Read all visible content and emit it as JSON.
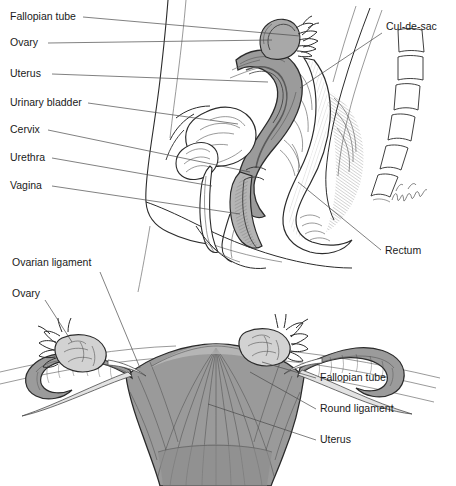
{
  "figure": {
    "background_color": "#ffffff",
    "ink_color": "#2b2b2b",
    "organ_fill_color": "#9b9b9b",
    "organ_fill_light": "#c3c3c3",
    "organ_fill_dark": "#7b7b7b",
    "panels": [
      {
        "name": "sagittal-section",
        "description": "Midsagittal section of the female pelvis"
      },
      {
        "name": "anterior-view",
        "description": "Anterior view of uterus, fallopian tubes and ovaries"
      }
    ]
  },
  "sagittal": {
    "labels_left": [
      {
        "id": "fallopian-tube",
        "text": "Fallopian tube",
        "x": 10,
        "y": 20
      },
      {
        "id": "ovary",
        "text": "Ovary",
        "x": 10,
        "y": 46
      },
      {
        "id": "uterus",
        "text": "Uterus",
        "x": 10,
        "y": 77
      },
      {
        "id": "urinary-bladder",
        "text": "Urinary bladder",
        "x": 10,
        "y": 106
      },
      {
        "id": "cervix",
        "text": "Cervix",
        "x": 10,
        "y": 133
      },
      {
        "id": "urethra",
        "text": "Urethra",
        "x": 10,
        "y": 161
      },
      {
        "id": "vagina",
        "text": "Vagina",
        "x": 10,
        "y": 189
      }
    ],
    "labels_right": [
      {
        "id": "cul-de-sac",
        "text": "Cul-de-sac",
        "x": 386,
        "y": 30
      },
      {
        "id": "rectum",
        "text": "Rectum",
        "x": 385,
        "y": 254
      }
    ]
  },
  "anterior": {
    "labels_left": [
      {
        "id": "ovarian-ligament",
        "text": "Ovarian ligament",
        "x": 12,
        "y": 266
      },
      {
        "id": "ovary",
        "text": "Ovary",
        "x": 12,
        "y": 297
      }
    ],
    "labels_right": [
      {
        "id": "fallopian-tube",
        "text": "Fallopian tube",
        "x": 320,
        "y": 381
      },
      {
        "id": "round-ligament",
        "text": "Round ligament",
        "x": 320,
        "y": 412
      },
      {
        "id": "uterus",
        "text": "Uterus",
        "x": 320,
        "y": 443
      }
    ]
  },
  "signature": {
    "name": "artist-signature",
    "text": ""
  }
}
